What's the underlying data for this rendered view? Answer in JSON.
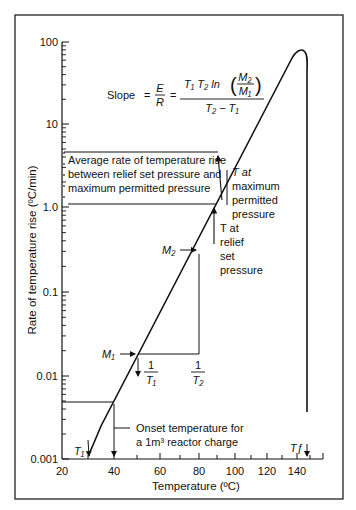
{
  "chart_data": {
    "type": "line",
    "title": "",
    "xlabel": "Temperature (ºC)",
    "ylabel": "Rate of temperature rise (ºC/min)",
    "yscale": "log",
    "xscale": "reciprocal-absolute-temperature (1/T)",
    "xlim": [
      20,
      155
    ],
    "ylim": [
      0.001,
      100
    ],
    "x_ticks": [
      "20",
      "40",
      "60",
      "80",
      "100",
      "120",
      "140"
    ],
    "y_ticks": [
      "0.001",
      "0.01",
      "0.1",
      "1.0",
      "10",
      "100"
    ],
    "grid": false,
    "legend": null,
    "series": [
      {
        "name": "Self-heating rate curve",
        "x": [
          30,
          40,
          50,
          60,
          80,
          88,
          100,
          120,
          135,
          140,
          143,
          145,
          146,
          146
        ],
        "y": [
          0.0012,
          0.005,
          0.017,
          0.06,
          0.5,
          1.1,
          3.5,
          20,
          55,
          70,
          70,
          55,
          30,
          0.004
        ]
      }
    ],
    "annotations": {
      "slope_formula": {
        "lhs": "Slope",
        "eq": "=",
        "frac_E": "E",
        "frac_R": "R",
        "eq2": "=",
        "num_T1T2": "T₁ T₂ ln",
        "M2": "M₂",
        "M1": "M₁",
        "den": "T₂ − T₁"
      },
      "average_rate": [
        "Average rate of temperature rise",
        "between relief set pressure and",
        "maximum permitted pressure"
      ],
      "t_max": [
        "T at",
        "maximum",
        "permitted",
        "pressure"
      ],
      "t_relief": [
        "T at",
        "relief",
        "set",
        "pressure"
      ],
      "m1": "M₁",
      "m2": "M₂",
      "inv_t1_num": "1",
      "inv_t1_den": "T₁",
      "inv_t2_num": "1",
      "inv_t2_den": "T₂",
      "onset": [
        "Onset temperature for",
        "a 1m³ reactor charge"
      ],
      "t1": "T₁",
      "tf": "Tƒ"
    },
    "points": {
      "M1": {
        "x": 50,
        "y": 0.017
      },
      "M2": {
        "x": 85,
        "y": 0.8
      },
      "T1_onset_1m3": {
        "x": 40,
        "y": 0.005
      },
      "T_relief_set": {
        "x": 88,
        "y": 1.1
      },
      "T_max_permitted": {
        "x": 102,
        "y": 4.5
      },
      "T1": {
        "x": 30
      },
      "TF": {
        "x": 146
      }
    }
  }
}
